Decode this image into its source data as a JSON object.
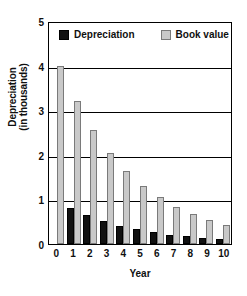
{
  "chart_data": {
    "type": "bar",
    "title": "",
    "xlabel": "Year",
    "ylabel": "Depreciation\n(in thousands)",
    "ylabel_lines": [
      "Depreciation",
      "(in thousands)"
    ],
    "categories": [
      "0",
      "1",
      "2",
      "3",
      "4",
      "5",
      "6",
      "7",
      "8",
      "9",
      "10"
    ],
    "ylim": [
      0,
      5
    ],
    "yticks": [
      "5",
      "4",
      "3",
      "2",
      "1",
      "0"
    ],
    "ytick_values": [
      5,
      4,
      3,
      2,
      1,
      0
    ],
    "grid": true,
    "legend_position": "top-inside",
    "series": [
      {
        "name": "Depreciation",
        "color": "#111111",
        "values": [
          null,
          0.8,
          0.64,
          0.51,
          0.41,
          0.33,
          0.26,
          0.21,
          0.17,
          0.13,
          0.11
        ]
      },
      {
        "name": "Book value",
        "color": "#c9c9c9",
        "values": [
          4.0,
          3.2,
          2.56,
          2.05,
          1.64,
          1.31,
          1.05,
          0.84,
          0.67,
          0.54,
          0.43
        ]
      }
    ]
  },
  "legend": {
    "items": [
      {
        "label": "Depreciation",
        "swatch": "black-square-icon"
      },
      {
        "label": "Book value",
        "swatch": "gray-square-icon"
      }
    ]
  },
  "axes": {
    "y_title_line1": "Depreciation",
    "y_title_line2": "(in thousands)",
    "x_title": "Year"
  }
}
